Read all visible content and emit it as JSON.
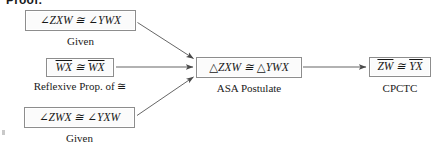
{
  "document": {
    "heading": "Proof:"
  },
  "flowchart": {
    "type": "geometry-proof-flowchart",
    "statements": [
      {
        "id": "given-angle-1",
        "text": "∠ZXW ≅ ∠YWX",
        "reason": "Given",
        "overlined": false
      },
      {
        "id": "reflexive-segment",
        "text_parts": [
          "WX",
          " ≅ ",
          "WX"
        ],
        "text": "WX ≅ WX",
        "reason": "Reflexive Prop. of ≅",
        "overlined": true
      },
      {
        "id": "given-angle-2",
        "text": "∠ZWX ≅ ∠YXW",
        "reason": "Given",
        "overlined": false
      },
      {
        "id": "triangle-congruence",
        "text": "△ZXW ≅ △YWX",
        "reason": "ASA Postulate",
        "overlined": false
      },
      {
        "id": "segment-congruence",
        "text_parts": [
          "ZW",
          " ≅ ",
          "YX"
        ],
        "text": "ZW ≅ YX",
        "reason": "CPCTC",
        "overlined": true
      }
    ],
    "arrows": [
      {
        "from": "given-angle-1",
        "to": "triangle-congruence"
      },
      {
        "from": "reflexive-segment",
        "to": "triangle-congruence"
      },
      {
        "from": "given-angle-2",
        "to": "triangle-congruence"
      },
      {
        "from": "triangle-congruence",
        "to": "segment-congruence"
      }
    ],
    "colors": {
      "box_border": "#8d8d8d",
      "box_fill": "#fbfbfb",
      "arrow": "#4a4a4a",
      "text": "#161616"
    }
  }
}
